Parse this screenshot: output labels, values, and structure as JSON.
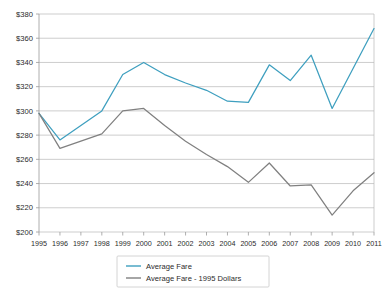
{
  "chart_data": {
    "type": "line",
    "title": "",
    "xlabel": "",
    "ylabel": "",
    "x": [
      1995,
      1996,
      1997,
      1998,
      1999,
      2000,
      2001,
      2002,
      2003,
      2004,
      2005,
      2006,
      2007,
      2008,
      2009,
      2010,
      2011
    ],
    "xtick_labels": [
      "1995",
      "1996",
      "1997",
      "1998",
      "1999",
      "2000",
      "2001",
      "2002",
      "2003",
      "2004",
      "2005",
      "2006",
      "2007",
      "2008",
      "2009",
      "2010",
      "2011"
    ],
    "ytick_labels": [
      "$200",
      "$220",
      "$240",
      "$260",
      "$280",
      "$300",
      "$320",
      "$340",
      "$360",
      "$380"
    ],
    "ytick_values": [
      200,
      220,
      240,
      260,
      280,
      300,
      320,
      340,
      360,
      380
    ],
    "ylim": [
      200,
      380
    ],
    "grid": "horizontal",
    "legend_position": "bottom-center",
    "series": [
      {
        "name": "Average Fare",
        "color": "#3E9FBF",
        "values": [
          298,
          276,
          288,
          300,
          330,
          340,
          330,
          323,
          317,
          308,
          307,
          338,
          325,
          346,
          302,
          335,
          368
        ]
      },
      {
        "name": "Average Fare - 1995 Dollars",
        "color": "#808080",
        "values": [
          298,
          269,
          275,
          281,
          300,
          302,
          288,
          275,
          264,
          254,
          241,
          257,
          238,
          239,
          214,
          234,
          249
        ]
      }
    ]
  },
  "legend": {
    "entries": [
      {
        "label": "Average Fare"
      },
      {
        "label": "Average Fare - 1995 Dollars"
      }
    ]
  },
  "colors": {
    "series_1": "#3E9FBF",
    "series_2": "#808080",
    "gridline": "#b8b8b8",
    "axis": "#9a9a9a",
    "text": "#2b2b2b",
    "background": "#ffffff"
  }
}
